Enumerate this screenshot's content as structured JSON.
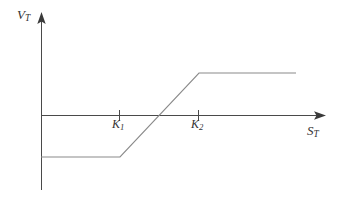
{
  "figure": {
    "title": "",
    "background_color": "#ffffff",
    "axis_color": "#4a4a4a",
    "curve_color": "#8a8a8a",
    "tick_color": "#4a4a4a",
    "label_color": "#333333",
    "width": 346,
    "height": 197
  },
  "axes": {
    "y_axis_label": "V",
    "y_axis_label_sub": "T",
    "x_axis_label": "S",
    "x_axis_label_sub": "T",
    "origin": {
      "x": 41,
      "y": 115
    },
    "y_axis_top": 14,
    "y_axis_bottom": 190,
    "x_axis_right": 325,
    "x_axis_arrow": true,
    "y_axis_arrow": true
  },
  "ticks": [
    {
      "name": "K1",
      "label": "K",
      "sub": "1",
      "x": 120
    },
    {
      "name": "K2",
      "label": "K",
      "sub": "2",
      "x": 199
    }
  ],
  "chart_data": {
    "type": "line",
    "title": "",
    "xlabel": "S_T",
    "ylabel": "V_T",
    "grid": false,
    "legend": null,
    "annotations": [
      "K_1",
      "K_2"
    ],
    "xlim": [
      0,
      330
    ],
    "ylim": [
      -60,
      60
    ],
    "series": [
      {
        "name": "V_T payoff",
        "color": "#8a8a8a",
        "x": [
          41,
          120,
          199,
          296
        ],
        "y": [
          -42,
          -42,
          42,
          42
        ],
        "points_px": [
          {
            "x": 41,
            "y": 157
          },
          {
            "x": 120,
            "y": 157
          },
          {
            "x": 199,
            "y": 73
          },
          {
            "x": 296,
            "y": 73
          }
        ]
      }
    ],
    "x_tick_labels": [
      "K_1",
      "K_2"
    ],
    "x_tick_values": [
      120,
      199
    ],
    "y_tick_labels": [],
    "y_tick_values": []
  }
}
